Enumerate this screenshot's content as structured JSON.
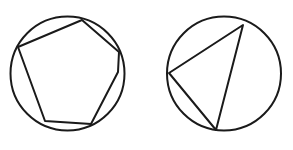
{
  "canvas": {
    "width": 293,
    "height": 150,
    "background_color": "#ffffff",
    "stroke_color": "#1a1a1a",
    "stroke_width": 2
  },
  "figures": [
    {
      "name": "hexagon-in-circle",
      "circle": {
        "cx": 67.5,
        "cy": 73.5,
        "r": 57
      },
      "polygon": {
        "sides": 6,
        "shape": "hexagon",
        "points": "82,20 119,52 118,72 91,124 45,121 18,47"
      }
    },
    {
      "name": "triangle-in-circle",
      "circle": {
        "cx": 224,
        "cy": 73.5,
        "r": 57
      },
      "polygon": {
        "sides": 3,
        "shape": "triangle",
        "points": "243,25 216,130 169,73"
      }
    }
  ]
}
